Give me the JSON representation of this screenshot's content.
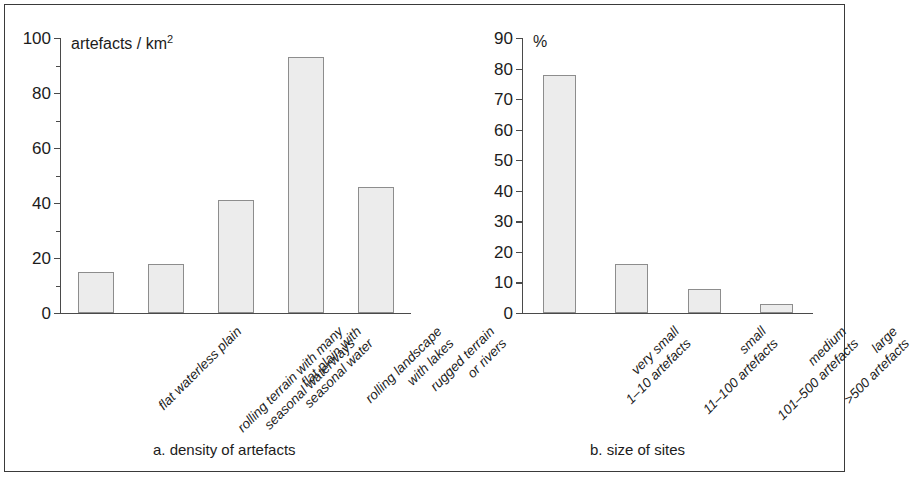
{
  "figure": {
    "border_color": "#3a3a3a",
    "background": "#ffffff"
  },
  "chart_data": [
    {
      "type": "bar",
      "panel": "a",
      "title": "",
      "caption": "a. density of artefacts",
      "ylabel": "artefacts / km2",
      "ylabel_base": "artefacts / km",
      "ylabel_sup": "2",
      "xlabel": "",
      "ylim": [
        0,
        100
      ],
      "ytick_step": 20,
      "yminor_step": 10,
      "grid": false,
      "legend": "none",
      "tick_labels": [
        "0",
        "20",
        "40",
        "60",
        "80",
        "100"
      ],
      "categories": [
        "flat waterless plain",
        "rolling terrain with many seasonal waterways",
        "flat plain with seasonal water",
        "rolling landscape with lakes",
        "rugged terrain or rivers"
      ],
      "category_lines": [
        [
          "flat waterless plain"
        ],
        [
          "rolling terrain with many",
          "seasonal waterways"
        ],
        [
          "flat plain with",
          "seasonal water"
        ],
        [
          "rolling landscape",
          "with lakes"
        ],
        [
          "rugged terrain",
          "or rivers"
        ]
      ],
      "values": [
        15,
        18,
        41,
        93,
        46
      ],
      "bar_fill": "#ececec",
      "bar_stroke": "#8d8d8d"
    },
    {
      "type": "bar",
      "panel": "b",
      "title": "",
      "caption": "b. size of sites",
      "ylabel": "%",
      "xlabel": "",
      "ylim": [
        0,
        90
      ],
      "ytick_step": 10,
      "yminor_step": 10,
      "grid": false,
      "legend": "none",
      "tick_labels": [
        "0",
        "10",
        "20",
        "30",
        "40",
        "50",
        "60",
        "70",
        "80",
        "90"
      ],
      "categories": [
        "very small 1-10 artefacts",
        "small 11-100 artefacts",
        "medium 101-500 artefacts",
        "large >500 artefacts"
      ],
      "category_lines": [
        [
          "very small",
          "1–10 artefacts"
        ],
        [
          "small",
          "11–100 artefacts"
        ],
        [
          "medium",
          "101–500 artefacts"
        ],
        [
          "large",
          ">500 artefacts"
        ]
      ],
      "values": [
        78,
        16,
        8,
        3
      ],
      "bar_fill": "#ececec",
      "bar_stroke": "#8d8d8d"
    }
  ]
}
